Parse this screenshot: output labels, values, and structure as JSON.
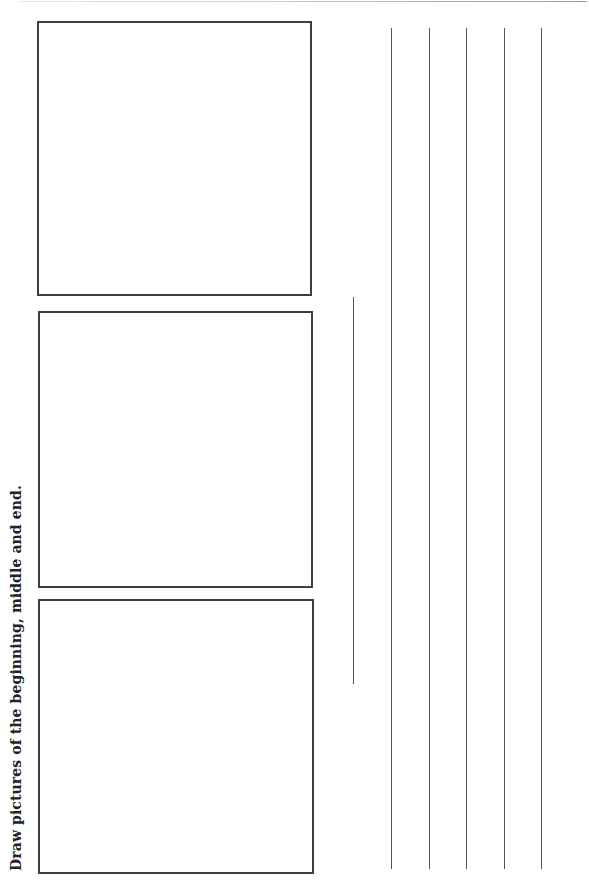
{
  "worksheet": {
    "instruction": "Draw pictures of the beginning, middle and end.",
    "drawing_boxes": [
      {
        "label": "beginning"
      },
      {
        "label": "middle"
      },
      {
        "label": "end"
      }
    ],
    "writing_lines": {
      "short_line_count": 1,
      "long_line_count": 5
    },
    "colors": {
      "border": "#3f3f3f",
      "line": "#555555",
      "text": "#222222",
      "background": "#ffffff"
    }
  }
}
